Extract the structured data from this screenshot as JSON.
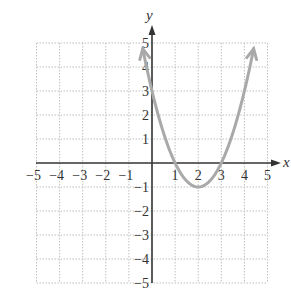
{
  "chart_data": {
    "type": "line",
    "title": "",
    "xlabel": "x",
    "ylabel": "y",
    "xlim": [
      -5,
      5
    ],
    "ylim": [
      -5,
      5
    ],
    "grid": true,
    "x_ticks": [
      "−5",
      "−4",
      "−3",
      "−2",
      "−1",
      "1",
      "2",
      "3",
      "4",
      "5"
    ],
    "y_ticks": [
      "5",
      "4",
      "3",
      "2",
      "1",
      "−1",
      "−2",
      "−3",
      "−4",
      "−5"
    ],
    "series": [
      {
        "name": "parabola",
        "equation": "y = (x-1)(x-3) = x^2 - 4x + 3",
        "x": [
          -0.4,
          0,
          0.5,
          1,
          1.5,
          2,
          2.5,
          3,
          3.5,
          4,
          4.4
        ],
        "y": [
          4.76,
          3,
          1.25,
          0,
          -0.75,
          -1,
          -0.75,
          0,
          1.25,
          3,
          4.76
        ],
        "vertex": [
          2,
          -1
        ],
        "x_intercepts": [
          1,
          3
        ],
        "y_intercept": 3,
        "arrows_at_ends": true,
        "color": "#a9a9a9"
      }
    ]
  },
  "labels": {
    "x_axis": "x",
    "y_axis": "y"
  }
}
